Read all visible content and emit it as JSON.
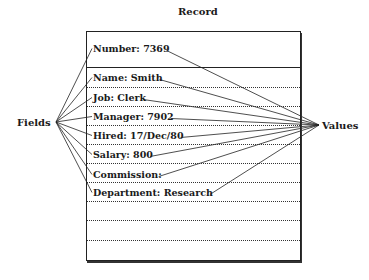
{
  "title": "Record",
  "left_label": "Fields",
  "right_label": "Values",
  "fields": [
    {
      "text": "Number: 7369"
    },
    {
      "text": "Name: Smith"
    },
    {
      "text": "Job: Clerk"
    },
    {
      "text": "Manager: 7902"
    },
    {
      "text": "Hired: 17/Dec/80"
    },
    {
      "text": "Salary: 800"
    },
    {
      "text": "Commission:"
    },
    {
      "text": "Department: Research"
    }
  ],
  "empty_rows": 3
}
